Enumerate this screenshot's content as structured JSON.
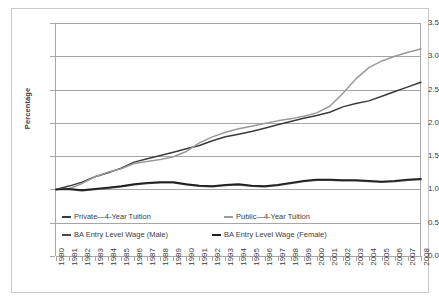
{
  "chart_data": {
    "type": "line",
    "title": "",
    "xlabel": "",
    "ylabel": "Percentage",
    "xlim": [
      1980,
      2008
    ],
    "ylim": [
      0.0,
      3.5
    ],
    "ytick_labels": [
      "0.0",
      "0.5",
      "1.0",
      "1.5",
      "2.0",
      "2.5",
      "3.0",
      "3.5"
    ],
    "ytick_values": [
      0.0,
      0.5,
      1.0,
      1.5,
      2.0,
      2.5,
      3.0,
      3.5
    ],
    "grid": "horizontal",
    "legend_position": "inside-bottom-left",
    "categories": [
      "1980",
      "1981",
      "1982",
      "1983",
      "1984",
      "1985",
      "1986",
      "1987",
      "1988",
      "1989",
      "1990",
      "1991",
      "1992",
      "1993",
      "1994",
      "1995",
      "1996",
      "1997",
      "1998",
      "1999",
      "2000",
      "2001",
      "2002",
      "2003",
      "2004",
      "2005",
      "2006",
      "2007",
      "2008"
    ],
    "series": [
      {
        "name": "Private—4-Year Tuition",
        "color": "#3b3b3b",
        "values": [
          1.0,
          1.05,
          1.11,
          1.19,
          1.25,
          1.32,
          1.41,
          1.46,
          1.51,
          1.56,
          1.61,
          1.66,
          1.73,
          1.79,
          1.83,
          1.87,
          1.92,
          1.97,
          2.02,
          2.07,
          2.11,
          2.16,
          2.24,
          2.29,
          2.33,
          2.4,
          2.47,
          2.54,
          2.61
        ]
      },
      {
        "name": "Public—4-Year Tuition",
        "color": "#9a9a9a",
        "values": [
          1.0,
          1.01,
          1.09,
          1.19,
          1.26,
          1.31,
          1.39,
          1.42,
          1.45,
          1.49,
          1.57,
          1.7,
          1.79,
          1.86,
          1.91,
          1.95,
          1.99,
          2.03,
          2.06,
          2.1,
          2.15,
          2.25,
          2.44,
          2.66,
          2.83,
          2.93,
          3.0,
          3.06,
          3.11
        ]
      },
      {
        "name": "BA Entry Level Wage (Male)",
        "color": "#4a4a4a",
        "values": [
          1.0,
          1.0,
          0.98,
          1.0,
          1.02,
          1.04,
          1.07,
          1.09,
          1.1,
          1.1,
          1.07,
          1.05,
          1.04,
          1.06,
          1.07,
          1.05,
          1.04,
          1.06,
          1.09,
          1.12,
          1.14,
          1.14,
          1.13,
          1.13,
          1.12,
          1.11,
          1.12,
          1.14,
          1.15
        ]
      },
      {
        "name": "BA Entry Level Wage (Female)",
        "color": "#1f1f1f",
        "values": [
          1.0,
          1.01,
          0.99,
          1.01,
          1.03,
          1.05,
          1.08,
          1.1,
          1.11,
          1.11,
          1.08,
          1.06,
          1.05,
          1.07,
          1.08,
          1.06,
          1.05,
          1.07,
          1.1,
          1.13,
          1.15,
          1.15,
          1.14,
          1.14,
          1.13,
          1.12,
          1.13,
          1.15,
          1.16
        ]
      }
    ]
  },
  "legend": {
    "entries": [
      {
        "label": "Private—4-Year Tuition",
        "color": "#3b3b3b"
      },
      {
        "label": "Public—4-Year Tuition",
        "color": "#9a9a9a"
      },
      {
        "label": "BA Entry Level Wage (Male)",
        "color": "#4a4a4a"
      },
      {
        "label": "BA Entry Level Wage (Female)",
        "color": "#1f1f1f"
      }
    ]
  },
  "colors": {
    "grid": "#a6a6a6",
    "axis": "#a6a6a6",
    "text": "#3c3c3c",
    "frame": "#c9c9c9",
    "background": "#ffffff"
  }
}
